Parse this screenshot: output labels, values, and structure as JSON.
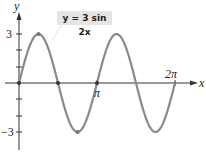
{
  "chart_data": {
    "type": "line",
    "title": "",
    "equation_label": "y = 3 sin 2x",
    "xlabel": "x",
    "ylabel": "y",
    "x_ticks": [
      {
        "value": 3.14159,
        "label": "π"
      },
      {
        "value": 6.28318,
        "label": "2π"
      }
    ],
    "y_ticks": [
      {
        "value": 3,
        "label": "3"
      },
      {
        "value": -3,
        "label": "−3"
      }
    ],
    "xlim": [
      0,
      6.9
    ],
    "ylim": [
      -4.2,
      4.2
    ],
    "series": [
      {
        "name": "y = 3 sin 2x",
        "function": "3*sin(2*x)",
        "x_range": [
          0,
          6.28318
        ],
        "color": "#8a8a8a"
      }
    ],
    "marked_points": [
      [
        0,
        0
      ],
      [
        0.785,
        3
      ],
      [
        1.571,
        0
      ],
      [
        2.356,
        -3
      ],
      [
        3.142,
        0
      ]
    ],
    "grid": false
  },
  "labels": {
    "y_axis": "y",
    "x_axis": "x",
    "pi": "π",
    "two_pi": "2π",
    "three": "3",
    "neg_three": "−3",
    "equation": "y = 3 sin 2x"
  }
}
